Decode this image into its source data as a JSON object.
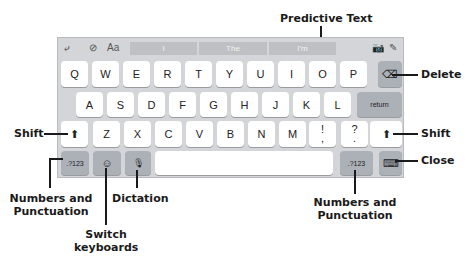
{
  "toolbar": {
    "undo_icon": "undo-icon",
    "check_icon": "checkmark-circle-icon",
    "format_label": "Aa",
    "camera_icon": "camera-icon",
    "scribble_icon": "scribble-pen-icon"
  },
  "predictive": [
    "I",
    "The",
    "I'm"
  ],
  "rows": {
    "row1": [
      "Q",
      "W",
      "E",
      "R",
      "T",
      "Y",
      "U",
      "I",
      "O",
      "P"
    ],
    "row2": [
      "A",
      "S",
      "D",
      "F",
      "G",
      "H",
      "J",
      "K",
      "L"
    ],
    "row3": [
      "Z",
      "X",
      "C",
      "V",
      "B",
      "N",
      "M"
    ],
    "punct1": {
      "top": "!",
      "bottom": ","
    },
    "punct2": {
      "top": "?",
      "bottom": "."
    }
  },
  "keys": {
    "return": "return",
    "numbers_left": ".?123",
    "numbers_right": ".?123",
    "shift_glyph": "⬆",
    "delete_glyph": "⌫",
    "emoji_glyph": "☺",
    "mic_glyph": "🎙",
    "close_glyph": "⌨"
  },
  "callouts": {
    "predictive_text": "Predictive Text",
    "delete": "Delete",
    "shift_left": "Shift",
    "shift_right": "Shift",
    "close": "Close",
    "numbers_left_line1": "Numbers and",
    "numbers_left_line2": "Punctuation",
    "dictation": "Dictation",
    "switch_line1": "Switch",
    "switch_line2": "keyboards",
    "numbers_right_line1": "Numbers and",
    "numbers_right_line2": "Punctuation"
  },
  "colors": {
    "keyboard_bg": "#d4d5d8",
    "key_light": "#ffffff",
    "key_dark": "#acb0b7",
    "callout_text": "#1a1a1a"
  }
}
